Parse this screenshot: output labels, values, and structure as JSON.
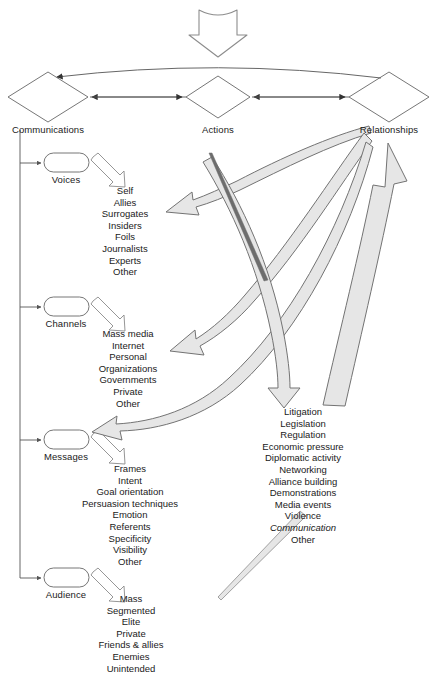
{
  "diagram": {
    "title_present": false,
    "colors": {
      "line": "#4d4d4d",
      "text": "#1a1a1a",
      "arrow_fill": "#e3e3e3",
      "arrow_stroke": "#6b6b6b",
      "background": "#ffffff"
    },
    "top_inflow_arrow": {
      "name": "input-block-arrow",
      "direction": "down"
    },
    "tiers": [
      {
        "id": "communications",
        "label": "Communications",
        "shape": "diamond",
        "cx": 48,
        "cy": 97
      },
      {
        "id": "actions",
        "label": "Actions",
        "shape": "diamond",
        "cx": 218,
        "cy": 97
      },
      {
        "id": "relationships",
        "label": "Relationships",
        "shape": "diamond",
        "cx": 389,
        "cy": 97
      }
    ],
    "branches": [
      {
        "id": "voices",
        "label": "Voices",
        "cx": 66,
        "cy": 163,
        "list_cx": 125,
        "list_top": 185,
        "items": [
          {
            "text": "Self"
          },
          {
            "text": "Allies"
          },
          {
            "text": "Surrogates"
          },
          {
            "text": "Insiders"
          },
          {
            "text": "Foils"
          },
          {
            "text": "Journalists"
          },
          {
            "text": "Experts"
          },
          {
            "text": "Other"
          }
        ]
      },
      {
        "id": "channels",
        "label": "Channels",
        "cx": 66,
        "cy": 307,
        "list_cx": 128,
        "list_top": 328,
        "items": [
          {
            "text": "Mass media"
          },
          {
            "text": "Internet"
          },
          {
            "text": "Personal"
          },
          {
            "text": "Organizations"
          },
          {
            "text": "Governments"
          },
          {
            "text": "Private"
          },
          {
            "text": "Other"
          }
        ]
      },
      {
        "id": "messages",
        "label": "Messages",
        "cx": 66,
        "cy": 440,
        "list_cx": 130,
        "list_top": 463,
        "items": [
          {
            "text": "Frames"
          },
          {
            "text": "Intent"
          },
          {
            "text": "Goal orientation"
          },
          {
            "text": "Persuasion techniques"
          },
          {
            "text": "Emotion"
          },
          {
            "text": "Referents"
          },
          {
            "text": "Specificity"
          },
          {
            "text": "Visibility"
          },
          {
            "text": "Other"
          }
        ]
      },
      {
        "id": "audience",
        "label": "Audience",
        "cx": 66,
        "cy": 578,
        "list_cx": 131,
        "list_top": 593,
        "items": [
          {
            "text": "Mass"
          },
          {
            "text": "Segmented"
          },
          {
            "text": "Elite"
          },
          {
            "text": "Private"
          },
          {
            "text": "Friends & allies"
          },
          {
            "text": "Enemies"
          },
          {
            "text": "Unintended"
          }
        ]
      }
    ],
    "actions_list": {
      "id": "actions-items",
      "cx": 303,
      "top": 406,
      "items": [
        {
          "text": "Litigation",
          "italic": false
        },
        {
          "text": "Legislation",
          "italic": false
        },
        {
          "text": "Regulation",
          "italic": false
        },
        {
          "text": "Economic pressure",
          "italic": false
        },
        {
          "text": "Diplomatic activity",
          "italic": false
        },
        {
          "text": "Networking",
          "italic": false
        },
        {
          "text": "Alliance building",
          "italic": false
        },
        {
          "text": "Demonstrations",
          "italic": false
        },
        {
          "text": "Media events",
          "italic": false
        },
        {
          "text": "Violence",
          "italic": false
        },
        {
          "text": "Communication",
          "italic": true
        },
        {
          "text": "Other",
          "italic": false
        }
      ]
    },
    "flow_arrows": [
      {
        "name": "feedback-to-voices",
        "from": "relationships",
        "to": "voices"
      },
      {
        "name": "feedback-to-channels",
        "from": "relationships",
        "to": "channels"
      },
      {
        "name": "feedback-to-messages",
        "from": "relationships",
        "to": "messages"
      },
      {
        "name": "communications-to-actions-list",
        "from": "communications",
        "to": "actions-items"
      },
      {
        "name": "audience-to-relationships",
        "from": "audience",
        "to": "relationships"
      }
    ]
  }
}
